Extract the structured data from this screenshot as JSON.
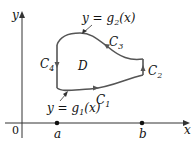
{
  "figure": {
    "axes": {
      "x_label": "x",
      "y_label": "y",
      "origin_label": "0"
    },
    "points": [
      {
        "label": "a",
        "x": 57
      },
      {
        "label": "b",
        "x": 142
      }
    ],
    "region_label": "D",
    "curves": [
      {
        "id": "C1",
        "name": "C",
        "sub": "1",
        "direction": "right"
      },
      {
        "id": "C2",
        "name": "C",
        "sub": "2",
        "direction": "up"
      },
      {
        "id": "C3",
        "name": "C",
        "sub": "3",
        "direction": "left"
      },
      {
        "id": "C4",
        "name": "C",
        "sub": "4",
        "direction": "down"
      }
    ],
    "function_labels": {
      "upper": {
        "prefix": "y = g",
        "sub": "2",
        "suffix": "(x)"
      },
      "lower": {
        "prefix": "y = g",
        "sub": "1",
        "suffix": "(x)"
      }
    },
    "colors": {
      "curve": "#555555",
      "axis": "#333333",
      "text": "#111111"
    }
  }
}
